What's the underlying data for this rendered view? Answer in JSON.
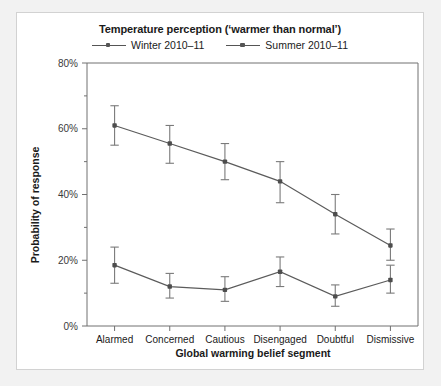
{
  "chart_data": {
    "type": "line",
    "xlabel": "Global warming belief segment",
    "ylabel": "Probability of response",
    "categories": [
      "Alarmed",
      "Concerned",
      "Cautious",
      "Disengaged",
      "Doubtful",
      "Dismissive"
    ],
    "ylim": [
      0,
      80
    ],
    "yticks": [
      0,
      20,
      40,
      60,
      80
    ],
    "ytick_labels": [
      "0%",
      "20%",
      "40%",
      "60%",
      "80%"
    ],
    "yminor_ticks": [
      10,
      30,
      50,
      70
    ],
    "grid": false,
    "legend_position": "top",
    "series": [
      {
        "name": "Winter 2010-11",
        "values": [
          61,
          55.5,
          50,
          44,
          34,
          24.5
        ],
        "err_low": [
          55,
          49.5,
          44.5,
          37.5,
          28,
          20
        ],
        "err_high": [
          67,
          61,
          55.5,
          50,
          40,
          29.5
        ],
        "color": "#5b5b5b"
      },
      {
        "name": "Summer 2010-11",
        "values": [
          18.5,
          12,
          11,
          16.5,
          9,
          14
        ],
        "err_low": [
          13,
          8.5,
          7.5,
          12,
          6,
          10
        ],
        "err_high": [
          24,
          16,
          15,
          21,
          12.5,
          18.5
        ],
        "color": "#5b5b5b"
      }
    ]
  },
  "legend": {
    "entries": [
      {
        "label": "Winter 2010–11"
      },
      {
        "label": "Summer 2010–11"
      }
    ]
  },
  "title_display": "Temperature perception (‘warmer than normal’)",
  "axis": {
    "x_title": "Global warming belief segment",
    "y_title": "Probability of response"
  }
}
